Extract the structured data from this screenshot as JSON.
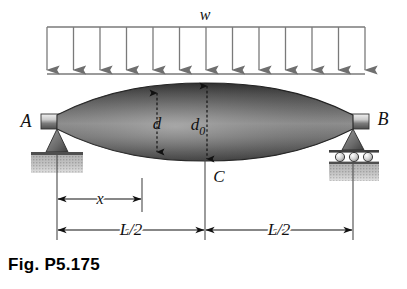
{
  "figure": {
    "caption": "Fig. P5.175",
    "type": "engineering-beam-diagram"
  },
  "load": {
    "label": "w",
    "arrow_count": 13,
    "span_left_px": 47,
    "span_right_px": 365,
    "top_rule_y_px": 27,
    "bottom_rule_y_px": 74,
    "color": "#7a7a7a"
  },
  "beam": {
    "shape": "lens",
    "left_end_x_px": 57,
    "right_end_x_px": 353,
    "midspan_x_px": 205,
    "centerline_y_px": 122,
    "max_half_depth_px": 39,
    "end_half_depth_px": 7,
    "fill_dark": "#4a4a4a",
    "fill_mid": "#6e6e6e",
    "fill_light": "#9a9a9a",
    "outline": "#2b2b2b"
  },
  "supports": {
    "left": {
      "label": "A",
      "type": "pin",
      "x_px": 57,
      "label_x_px": 26,
      "label_y_px": 127
    },
    "right": {
      "label": "B",
      "type": "roller",
      "roller_count": 3,
      "x_px": 353,
      "label_x_px": 380,
      "label_y_px": 125
    }
  },
  "labels": {
    "midspan_point": "C",
    "depth_at_x": "d",
    "depth_at_midspan_base": "d",
    "depth_at_midspan_sub": "0"
  },
  "dimensions": [
    {
      "name": "x",
      "label": "x",
      "from_x_px": 57,
      "to_x_px": 142,
      "y_px": 199
    },
    {
      "name": "half-span-left",
      "label": "L/2",
      "from_x_px": 57,
      "to_x_px": 205,
      "y_px": 230
    },
    {
      "name": "half-span-right",
      "label": "L/2",
      "from_x_px": 205,
      "to_x_px": 353,
      "y_px": 230
    }
  ],
  "colors": {
    "ink": "#111111",
    "rule": "#7a7a7a",
    "ground": "#b4b4b4",
    "paper": "#ffffff"
  }
}
